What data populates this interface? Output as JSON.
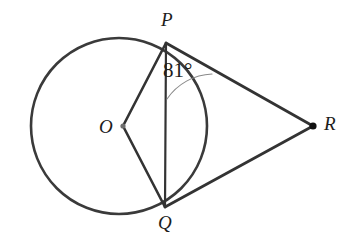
{
  "figure": {
    "background_color": "#ffffff",
    "stroke_color": "#3a3a3a",
    "thick_stroke_color": "#333333",
    "arc_color": "#8a8a8a",
    "text_color": "#1c1c1c"
  },
  "circle": {
    "center_x": 119,
    "center_y": 126,
    "radius": 88,
    "stroke_width": 2.6
  },
  "points": {
    "O": {
      "label": "O",
      "x": 123,
      "y": 126,
      "label_x": 99,
      "label_y": 117,
      "dot": true,
      "dot_r": 2.6
    },
    "P": {
      "label": "P",
      "x": 166,
      "y": 43,
      "label_x": 161,
      "label_y": 10,
      "dot": false,
      "dot_r": 0
    },
    "Q": {
      "label": "Q",
      "x": 165,
      "y": 207,
      "label_x": 158,
      "label_y": 213,
      "dot": false,
      "dot_r": 0
    },
    "R": {
      "label": "R",
      "x": 313,
      "y": 126,
      "label_x": 324,
      "label_y": 114,
      "dot": true,
      "dot_r": 3.6
    }
  },
  "segments": [
    {
      "name": "segment-OP",
      "from": "O",
      "to": "P",
      "stroke_width": 2.6
    },
    {
      "name": "segment-OQ",
      "from": "O",
      "to": "Q",
      "stroke_width": 2.6
    },
    {
      "name": "segment-PQ",
      "from": "P",
      "to": "Q",
      "stroke_width": 2.2
    },
    {
      "name": "segment-PR",
      "from": "P",
      "to": "R",
      "stroke_width": 2.8
    },
    {
      "name": "segment-QR",
      "from": "Q",
      "to": "R",
      "stroke_width": 2.8
    }
  ],
  "angle": {
    "label": "81°",
    "value": 81,
    "unit": "degrees",
    "at_vertex": "P",
    "between": [
      "PQ",
      "PR"
    ],
    "label_x": 163,
    "label_y": 60,
    "arc_radius": 57,
    "arc_stroke_width": 1.1,
    "arc_start_x": 212,
    "arc_start_y": 74,
    "arc_end_x": 167,
    "arc_end_y": 99
  },
  "chart_data": {
    "type": "diagram",
    "subtype": "euclidean-geometry",
    "labels": [
      "P",
      "O",
      "Q",
      "R",
      "81°"
    ],
    "annotations": [
      {
        "text": "81°",
        "describes": "angle QPR at vertex P",
        "value": 81
      }
    ],
    "elements": [
      {
        "kind": "circle",
        "center": [
          119,
          126
        ],
        "radius": 88
      },
      {
        "kind": "point",
        "name": "O",
        "position": [
          123,
          126
        ],
        "role": "center"
      },
      {
        "kind": "point",
        "name": "P",
        "position": [
          166,
          43
        ],
        "role": "tangency"
      },
      {
        "kind": "point",
        "name": "Q",
        "position": [
          165,
          207
        ],
        "role": "tangency"
      },
      {
        "kind": "point",
        "name": "R",
        "position": [
          313,
          126
        ],
        "role": "external"
      },
      {
        "kind": "segment",
        "name": "OP",
        "endpoints": [
          [
            123,
            126
          ],
          [
            166,
            43
          ]
        ]
      },
      {
        "kind": "segment",
        "name": "OQ",
        "endpoints": [
          [
            123,
            126
          ],
          [
            165,
            207
          ]
        ]
      },
      {
        "kind": "segment",
        "name": "PQ",
        "endpoints": [
          [
            166,
            43
          ],
          [
            165,
            207
          ]
        ]
      },
      {
        "kind": "segment",
        "name": "PR",
        "endpoints": [
          [
            166,
            43
          ],
          [
            313,
            126
          ]
        ]
      },
      {
        "kind": "segment",
        "name": "QR",
        "endpoints": [
          [
            165,
            207
          ],
          [
            313,
            126
          ]
        ]
      },
      {
        "kind": "angle-arc",
        "name": "angle-QPR",
        "vertex": [
          166,
          43
        ],
        "measure": 81
      }
    ]
  }
}
